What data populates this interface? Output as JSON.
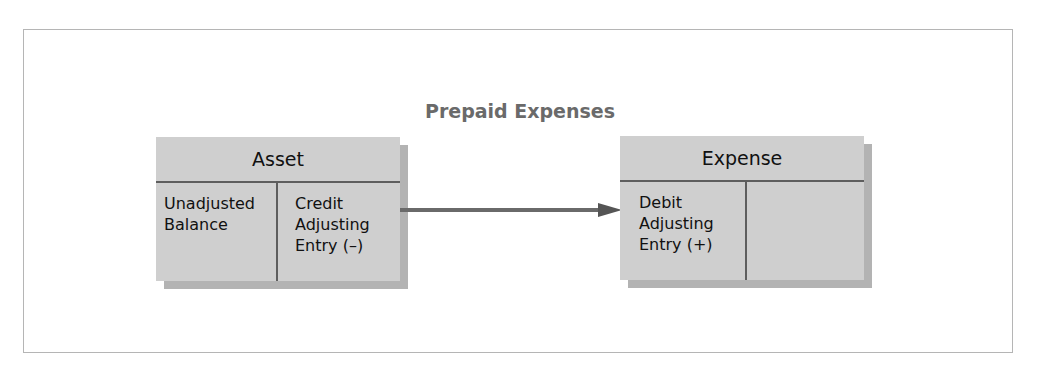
{
  "diagram": {
    "title": "Prepaid Expenses",
    "colors": {
      "frame_border": "#b5b5b5",
      "box_fill": "#cfcfcf",
      "box_shadow": "#b3b3b3",
      "divider": "#5e5e5e",
      "arrow": "#6a6a6a",
      "title_text": "#6a6a6a"
    },
    "accounts": [
      {
        "name": "Asset",
        "left_cell": [
          "Unadjusted",
          "Balance"
        ],
        "right_cell": [
          "Credit",
          "Adjusting",
          "Entry (–)"
        ]
      },
      {
        "name": "Expense",
        "left_cell": [
          "Debit",
          "Adjusting",
          "Entry (+)"
        ],
        "right_cell": []
      }
    ],
    "connector": {
      "from": "Asset credit adjusting entry",
      "to": "Expense debit adjusting entry",
      "icon": "arrow-right-icon"
    }
  }
}
